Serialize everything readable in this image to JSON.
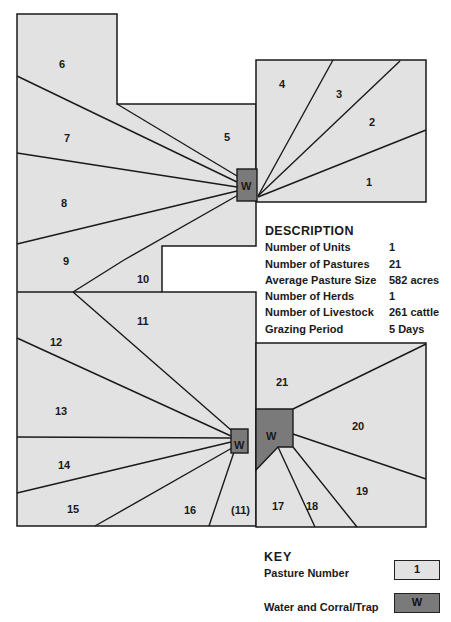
{
  "map": {
    "pastures": [
      {
        "id": "1",
        "label": "1"
      },
      {
        "id": "2",
        "label": "2"
      },
      {
        "id": "3",
        "label": "3"
      },
      {
        "id": "4",
        "label": "4"
      },
      {
        "id": "5",
        "label": "5"
      },
      {
        "id": "6",
        "label": "6"
      },
      {
        "id": "7",
        "label": "7"
      },
      {
        "id": "8",
        "label": "8"
      },
      {
        "id": "9",
        "label": "9"
      },
      {
        "id": "10",
        "label": "10"
      },
      {
        "id": "11",
        "label": "11"
      },
      {
        "id": "12",
        "label": "12"
      },
      {
        "id": "13",
        "label": "13"
      },
      {
        "id": "14",
        "label": "14"
      },
      {
        "id": "15",
        "label": "15"
      },
      {
        "id": "16",
        "label": "16"
      },
      {
        "id": "11b",
        "label": "(11)"
      },
      {
        "id": "17",
        "label": "17"
      },
      {
        "id": "18",
        "label": "18"
      },
      {
        "id": "19",
        "label": "19"
      },
      {
        "id": "20",
        "label": "20"
      },
      {
        "id": "21",
        "label": "21"
      }
    ],
    "water_label": "W",
    "colors": {
      "pasture_fill": "#e2e2e2",
      "water_fill": "#7a7a7a",
      "line": "#1a1a1a"
    }
  },
  "description": {
    "title": "DESCRIPTION",
    "rows": [
      {
        "key": "Number of Units",
        "value": "1"
      },
      {
        "key": "Number of Pastures",
        "value": "21"
      },
      {
        "key": "Average Pasture Size",
        "value": "582 acres"
      },
      {
        "key": "Number of Herds",
        "value": "1"
      },
      {
        "key": "Number of Livestock",
        "value": "261 cattle"
      },
      {
        "key": "Grazing Period",
        "value": "5 Days"
      }
    ]
  },
  "key": {
    "title": "KEY",
    "pasture_label": "Pasture Number",
    "pasture_sample": "1",
    "water_label": "Water and Corral/Trap",
    "water_sample": "W"
  }
}
